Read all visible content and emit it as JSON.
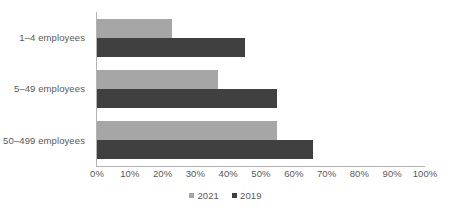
{
  "chart_data": {
    "type": "bar",
    "orientation": "horizontal",
    "title": "",
    "subtitle": "",
    "xlabel": "",
    "ylabel": "",
    "xlim": [
      0,
      100
    ],
    "grid": false,
    "legend_position": "bottom",
    "categories": [
      "1–4 employees",
      "5–49 employees",
      "50–499 employees"
    ],
    "xticks": [
      "0%",
      "10%",
      "20%",
      "30%",
      "40%",
      "50%",
      "60%",
      "70%",
      "80%",
      "90%",
      "100%"
    ],
    "xtick_values": [
      0,
      10,
      20,
      30,
      40,
      50,
      60,
      70,
      80,
      90,
      100
    ],
    "series": [
      {
        "name": "2021",
        "color": "#a6a6a6",
        "values": [
          23,
          37,
          55
        ]
      },
      {
        "name": "2019",
        "color": "#404040",
        "values": [
          45,
          55,
          66
        ]
      }
    ]
  },
  "legend": {
    "items": [
      {
        "label": "2021",
        "color": "#a6a6a6"
      },
      {
        "label": "2019",
        "color": "#404040"
      }
    ]
  },
  "axis": {
    "line_color": "#b3b3b3",
    "text_color": "#595959"
  }
}
